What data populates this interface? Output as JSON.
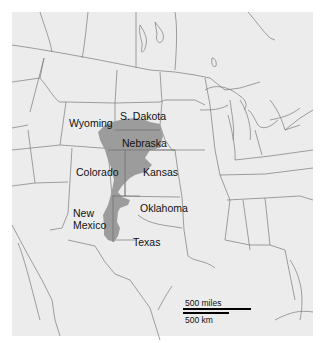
{
  "map": {
    "title": "",
    "background_color": "#ececec",
    "border_color": "#ffffff",
    "line_color": "#7a7a7a",
    "aquifer_color": "#9c9c9c",
    "highlight_region": "Shaded region spanning Nebraska, Kansas, Colorado, Oklahoma, New Mexico, Texas (Ogallala / High Plains aquifer)",
    "state_labels": [
      {
        "name": "Wyoming",
        "x": 69,
        "y": 119
      },
      {
        "name": "S. Dakota",
        "x": 119,
        "y": 111
      },
      {
        "name": "Nebraska",
        "x": 122,
        "y": 138
      },
      {
        "name": "Colorado",
        "x": 77,
        "y": 167
      },
      {
        "name": "Kansas",
        "x": 142,
        "y": 167
      },
      {
        "name": "Oklahoma",
        "x": 140,
        "y": 203
      },
      {
        "name": "New",
        "x": 73,
        "y": 208
      },
      {
        "name": "Mexico",
        "x": 73,
        "y": 220
      },
      {
        "name": "Texas",
        "x": 132,
        "y": 237
      }
    ],
    "scale": {
      "miles_label": "500 miles",
      "km_label": "500 km"
    }
  }
}
